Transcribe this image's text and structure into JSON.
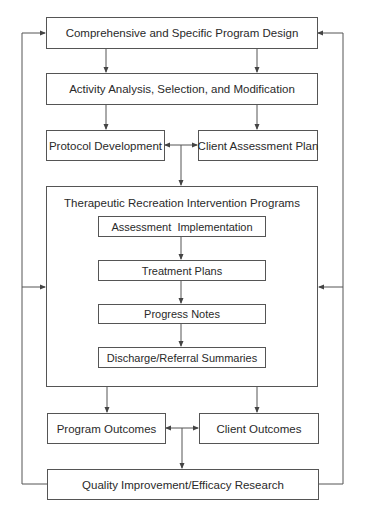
{
  "diagram": {
    "nodes": {
      "program_design": "Comprehensive and Specific Program Design",
      "activity_analysis": "Activity Analysis, Selection, and Modification",
      "protocol_development": "Protocol Development",
      "client_assessment_plan": "Client Assessment Plan",
      "intervention_programs": "Therapeutic Recreation Intervention Programs",
      "assessment_implementation": "Assessment  Implementation",
      "treatment_plans": "Treatment Plans",
      "progress_notes": "Progress Notes",
      "discharge_summaries": "Discharge/Referral Summaries",
      "program_outcomes": "Program Outcomes",
      "client_outcomes": "Client Outcomes",
      "quality_improvement": "Quality Improvement/Efficacy Research"
    },
    "edges": [
      {
        "from": "program_design",
        "to": "activity_analysis",
        "count": 2
      },
      {
        "from": "activity_analysis",
        "to": "protocol_development"
      },
      {
        "from": "activity_analysis",
        "to": "client_assessment_plan"
      },
      {
        "from": "protocol_development",
        "to": "client_assessment_plan",
        "bidirectional": true
      },
      {
        "from": "protocol_development/client_assessment_plan",
        "to": "intervention_programs"
      },
      {
        "from": "assessment_implementation",
        "to": "treatment_plans"
      },
      {
        "from": "treatment_plans",
        "to": "progress_notes"
      },
      {
        "from": "progress_notes",
        "to": "discharge_summaries"
      },
      {
        "from": "intervention_programs",
        "to": "program_outcomes"
      },
      {
        "from": "intervention_programs",
        "to": "client_outcomes"
      },
      {
        "from": "program_outcomes",
        "to": "client_outcomes",
        "bidirectional": true
      },
      {
        "from": "program_outcomes/client_outcomes",
        "to": "quality_improvement"
      },
      {
        "from": "quality_improvement",
        "to": "program_design",
        "via": "left and right feedback loops"
      },
      {
        "from": "quality_improvement",
        "to": "intervention_programs",
        "via": "left and right feedback loops"
      }
    ],
    "colors": {
      "line": "#555555",
      "text": "#2a2a2a",
      "background": "#ffffff"
    }
  }
}
